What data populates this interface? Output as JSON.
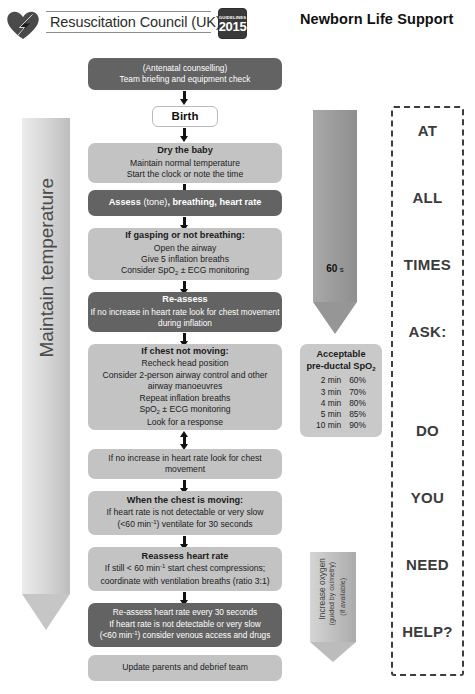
{
  "header": {
    "organisation": "Resuscitation Council (UK)",
    "badge_top": "GUIDELINES",
    "badge_year": "2015",
    "title": "Newborn Life Support",
    "logo_icon": "heart-lightning-icon"
  },
  "flow": {
    "antenatal": {
      "line1": "(Antenatal counselling)",
      "line2": "Team briefing and equipment check"
    },
    "birth": {
      "label": "Birth"
    },
    "dry_baby": {
      "title": "Dry the baby",
      "line1": "Maintain normal temperature",
      "line2": "Start the clock or note the time"
    },
    "assess": {
      "bold1": "Assess",
      "normal": "(tone)",
      "bold2": ", breathing, heart rate"
    },
    "gasping": {
      "title": "If gasping or not breathing:",
      "line1": "Open the airway",
      "line2": "Give 5 inflation breaths",
      "line3_pre": "Consider SpO",
      "line3_sub": "2",
      "line3_post": " ± ECG monitoring"
    },
    "reassess1": {
      "title": "Re-assess",
      "line1": "If no increase in heart rate look for chest movement",
      "line2": "during inflation"
    },
    "chest_not_moving": {
      "title": "If chest not moving:",
      "line1": "Recheck head position",
      "line2": "Consider 2-person airway control and other",
      "line3": "airway manoeuvres",
      "line4": "Repeat inflation breaths",
      "line5_pre": "SpO",
      "line5_sub": "2",
      "line5_post": " ± ECG monitoring",
      "line6": "Look for a response"
    },
    "no_increase": {
      "line1": "If no increase in heart rate look for chest",
      "line2": "movement"
    },
    "chest_moving": {
      "title": "When the chest is moving:",
      "line1": "If heart rate is not detectable or very slow",
      "line2_pre": "(<60 min",
      "line2_sup": "-1",
      "line2_post": ") ventilate for 30 seconds"
    },
    "reassess_hr": {
      "title": "Reassess heart rate",
      "line1_pre": "If still < 60 min",
      "line1_sup": "-1",
      "line1_post": " start chest compressions;",
      "line2": "coordinate with ventilation breaths (ratio 3:1)"
    },
    "reassess30": {
      "line1": "Re-assess heart rate every 30 seconds",
      "line2": "If heart rate is not detectable or very slow",
      "line3_pre": "(<60 min",
      "line3_sup": "-1",
      "line3_post": ") consider venous access and drugs"
    },
    "debrief": {
      "line1": "Update parents and debrief team"
    }
  },
  "side": {
    "maintain_temperature": "Maintain temperature",
    "sixty_seconds_value": "60",
    "sixty_seconds_unit": "s",
    "increase_oxygen_line1": "Increase oxygen",
    "increase_oxygen_line2": "(guided by oximetry)",
    "increase_oxygen_line3": "(if available)"
  },
  "spo2": {
    "title_line1": "Acceptable",
    "title_line2_pre": "pre-ductal SpO",
    "title_line2_sub": "2",
    "rows": [
      {
        "time": "2 min",
        "value": "60%"
      },
      {
        "time": "3 min",
        "value": "70%"
      },
      {
        "time": "4 min",
        "value": "80%"
      },
      {
        "time": "5 min",
        "value": "85%"
      },
      {
        "time": "10 min",
        "value": "90%"
      }
    ]
  },
  "ask_panel": {
    "words": [
      "AT",
      "ALL",
      "TIMES",
      "ASK:",
      "DO",
      "YOU",
      "NEED",
      "HELP?"
    ]
  },
  "colors": {
    "box_grey": "#c3c3c3",
    "box_dark": "#636363",
    "arrow_black": "#121212",
    "dashed_border": "#3d3d3d"
  }
}
